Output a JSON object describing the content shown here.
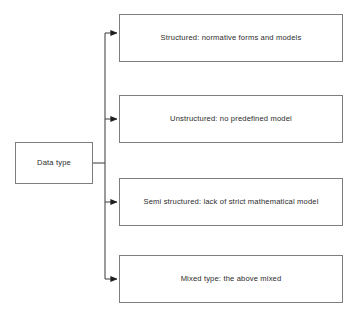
{
  "diagram": {
    "type": "tree",
    "title": "Data type",
    "root": {
      "label": "Data type"
    },
    "branches": [
      {
        "label": "Structured: normative forms and models"
      },
      {
        "label": "Unstructured:  no predefined model"
      },
      {
        "label": "Semi structured: lack of strict mathematical model"
      },
      {
        "label": "Mixed type: the above mixed"
      }
    ],
    "style": {
      "border_color": "#7d7d7d",
      "text_color": "#2b2b2b",
      "background": "#ffffff",
      "connector_color": "#4a4a4a"
    }
  }
}
